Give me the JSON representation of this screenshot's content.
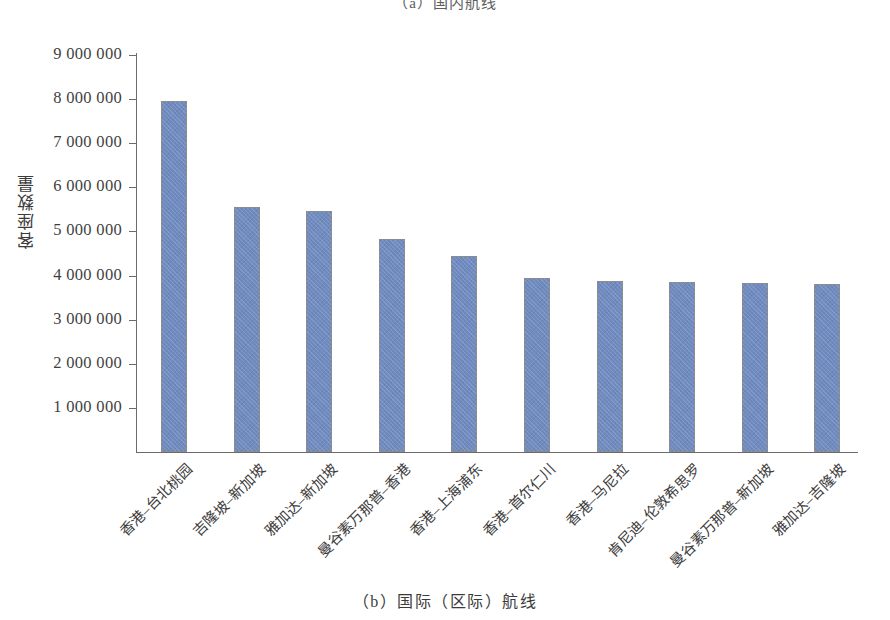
{
  "top_caption": "（a）国内航线",
  "bottom_caption": "（b）国际（区际）航线",
  "axis": {
    "ylabel": "客座数量",
    "ytick_labels": [
      "9 000 000",
      "8 000 000",
      "7 000 000",
      "6 000 000",
      "5 000 000",
      "4 000 000",
      "3 000 000",
      "2 000 000",
      "1 000 000"
    ]
  },
  "colors": {
    "bar_fill": "#6f8bc0",
    "bar_border": "#8c8c8c",
    "axis_line": "#6b6b6b",
    "text": "#3b3b3b",
    "background": "#ffffff"
  },
  "chart_data": {
    "type": "bar",
    "title": "（b）国际（区际）航线",
    "xlabel": "",
    "ylabel": "客座数量",
    "ylim": [
      0,
      9000000
    ],
    "ytick_values": [
      9000000,
      8000000,
      7000000,
      6000000,
      5000000,
      4000000,
      3000000,
      2000000,
      1000000
    ],
    "grid": false,
    "legend": null,
    "categories": [
      "香港–台北桃园",
      "吉隆坡–新加坡",
      "雅加达–新加坡",
      "曼谷素万那普–香港",
      "香港–上海浦东",
      "香港–首尔仁川",
      "香港–马尼拉",
      "肯尼迪–伦敦希思罗",
      "曼谷素万那普–新加坡",
      "雅加达–吉隆坡"
    ],
    "values": [
      7950000,
      5550000,
      5470000,
      4820000,
      4450000,
      3950000,
      3870000,
      3850000,
      3840000,
      3810000
    ]
  }
}
